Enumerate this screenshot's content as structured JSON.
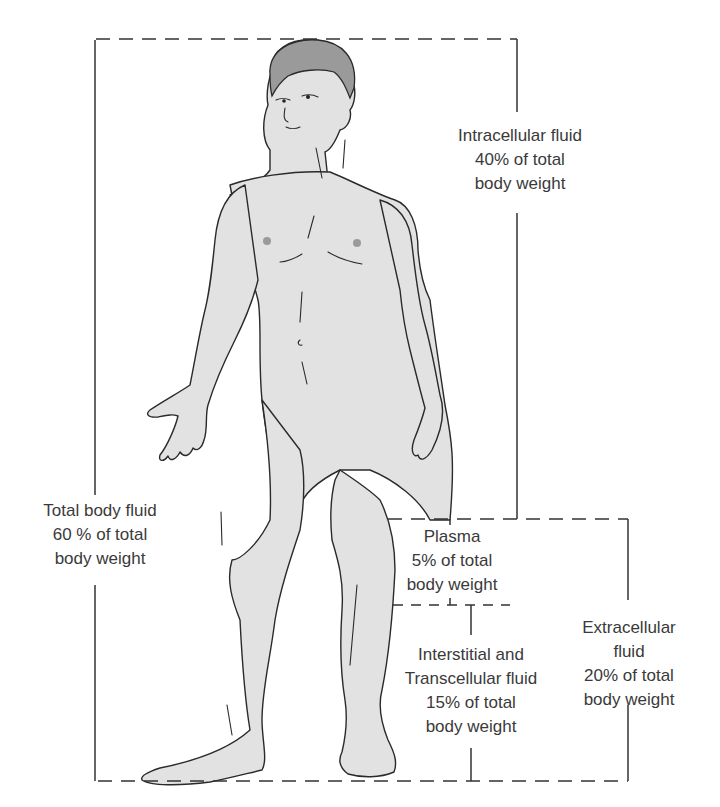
{
  "diagram": {
    "labels": {
      "intracellular": {
        "line1": "Intracellular fluid",
        "line2": "40% of total",
        "line3": "body weight"
      },
      "total": {
        "line1": "Total body fluid",
        "line2": "60 % of total",
        "line3": "body weight"
      },
      "plasma": {
        "line1": "Plasma",
        "line2": "5% of total",
        "line3": "body weight"
      },
      "interstitial": {
        "line1": "Interstitial and",
        "line2": "Transcellular fluid",
        "line3": "15% of total",
        "line4": "body weight"
      },
      "extracellular": {
        "line1": "Extracellular",
        "line2": "fluid",
        "line3": "20% of total",
        "line4": "body weight"
      }
    },
    "compartments": [
      {
        "name": "Total body fluid",
        "percent_body_weight": 60
      },
      {
        "name": "Intracellular fluid",
        "percent_body_weight": 40
      },
      {
        "name": "Extracellular fluid",
        "percent_body_weight": 20
      },
      {
        "name": "Plasma",
        "percent_body_weight": 5
      },
      {
        "name": "Interstitial and Transcellular fluid",
        "percent_body_weight": 15
      }
    ],
    "colors": {
      "line": "#333333",
      "skin": "#e2e2e2",
      "hair": "#9a9a9a",
      "outline": "#2a2a2a",
      "text": "#3a3a3a"
    }
  }
}
